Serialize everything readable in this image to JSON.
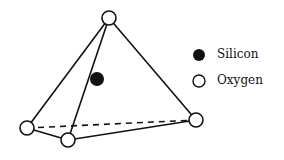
{
  "diagram": {
    "type": "silicon-oxygen tetrahedron",
    "stroke_color": "#111111",
    "nodes": {
      "top": {
        "x": 109,
        "y": 18,
        "type": "oxygen"
      },
      "left": {
        "x": 27,
        "y": 128,
        "type": "oxygen"
      },
      "bottom": {
        "x": 68,
        "y": 140,
        "type": "oxygen"
      },
      "right": {
        "x": 196,
        "y": 120,
        "type": "oxygen"
      },
      "center": {
        "x": 97,
        "y": 79,
        "type": "silicon"
      }
    },
    "edges_solid": [
      [
        "top",
        "left"
      ],
      [
        "top",
        "bottom"
      ],
      [
        "top",
        "right"
      ],
      [
        "left",
        "bottom"
      ],
      [
        "bottom",
        "right"
      ]
    ],
    "edges_dashed": [
      [
        "left",
        "right"
      ]
    ]
  },
  "legend": {
    "items": [
      {
        "label": "Silicon",
        "symbol": "filled-circle"
      },
      {
        "label": "Oxygen",
        "symbol": "open-circle"
      }
    ]
  }
}
